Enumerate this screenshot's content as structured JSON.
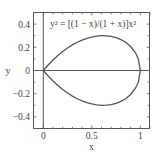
{
  "chart_data": {
    "type": "line",
    "title": "",
    "annotation": "y² = [(1 − x)/(1 + x)]x²",
    "xlabel": "x",
    "ylabel": "y",
    "xlim": [
      -0.1,
      1.1
    ],
    "ylim": [
      -0.5,
      0.5
    ],
    "xticks": [
      0,
      0.5,
      1
    ],
    "xtick_labels": [
      "0",
      "0.5",
      "1"
    ],
    "yticks": [
      0.4,
      0.2,
      0,
      -0.2,
      -0.4
    ],
    "ytick_labels": [
      "0.4",
      "0.2",
      "0",
      "−0.2",
      "−0.4"
    ],
    "grid": false,
    "legend": null,
    "reference_lines": {
      "x0_vertical": true,
      "y0_horizontal": true
    },
    "series": [
      {
        "name": "y = +x·sqrt((1−x)/(1+x))",
        "x": [
          0,
          0.05,
          0.1,
          0.15,
          0.2,
          0.25,
          0.3,
          0.35,
          0.4,
          0.45,
          0.5,
          0.55,
          0.6,
          0.618,
          0.65,
          0.7,
          0.75,
          0.8,
          0.85,
          0.9,
          0.95,
          0.98,
          1.0
        ],
        "y": [
          0,
          0.0476,
          0.0905,
          0.1286,
          0.1633,
          0.1936,
          0.2205,
          0.2436,
          0.2619,
          0.2772,
          0.2887,
          0.2963,
          0.3,
          0.3003,
          0.299,
          0.2937,
          0.2835,
          0.2667,
          0.2432,
          0.2065,
          0.1522,
          0.099,
          0
        ],
        "color": "#444444"
      },
      {
        "name": "y = −x·sqrt((1−x)/(1+x))",
        "x": [
          0,
          0.05,
          0.1,
          0.15,
          0.2,
          0.25,
          0.3,
          0.35,
          0.4,
          0.45,
          0.5,
          0.55,
          0.6,
          0.618,
          0.65,
          0.7,
          0.75,
          0.8,
          0.85,
          0.9,
          0.95,
          0.98,
          1.0
        ],
        "y": [
          0,
          -0.0476,
          -0.0905,
          -0.1286,
          -0.1633,
          -0.1936,
          -0.2205,
          -0.2436,
          -0.2619,
          -0.2772,
          -0.2887,
          -0.2963,
          -0.3,
          -0.3003,
          -0.299,
          -0.2937,
          -0.2835,
          -0.2667,
          -0.2432,
          -0.2065,
          -0.1522,
          -0.099,
          0
        ],
        "color": "#444444"
      }
    ]
  },
  "labels": {
    "annotation": "y² = [(1 − x)/(1 + x)]x²",
    "xlabel": "x",
    "ylabel": "y",
    "xtick_0": "0",
    "xtick_1": "0.5",
    "xtick_2": "1",
    "ytick_0": "0.4",
    "ytick_1": "0.2",
    "ytick_2": "0",
    "ytick_3": "−0.2",
    "ytick_4": "−0.4"
  }
}
